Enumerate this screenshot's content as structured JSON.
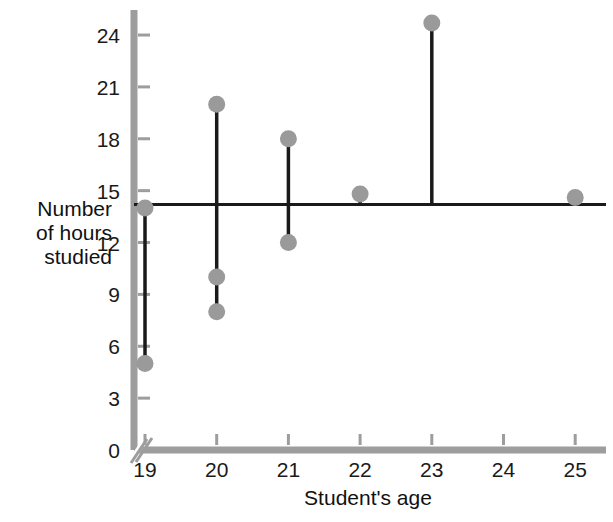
{
  "chart_data": {
    "type": "scatter",
    "title": "",
    "xlabel": "Student's age",
    "ylabel": "Number of hours studied",
    "ylabel_lines": [
      "Number",
      "of hours",
      "studied"
    ],
    "x": [
      19,
      20,
      21,
      22,
      23,
      24,
      25
    ],
    "xticklabels": [
      "19",
      "20",
      "21",
      "22",
      "23",
      "24",
      "25"
    ],
    "yticks": [
      0,
      3,
      6,
      9,
      12,
      15,
      18,
      21,
      24
    ],
    "yticklabels": [
      "0",
      "3",
      "6",
      "9",
      "12",
      "15",
      "18",
      "21",
      "24"
    ],
    "xlim": [
      18.6,
      25.6
    ],
    "ylim": [
      0,
      25.6
    ],
    "grid": false,
    "legend": null,
    "axis_break": true,
    "reference_line": {
      "name": "mean-line",
      "type": "horizontal",
      "value": 14.2,
      "color": "#1a1a1a"
    },
    "points": [
      {
        "x": 19,
        "y": 14.0
      },
      {
        "x": 19,
        "y": 5.0
      },
      {
        "x": 20,
        "y": 20.0
      },
      {
        "x": 20,
        "y": 10.0
      },
      {
        "x": 20,
        "y": 8.0
      },
      {
        "x": 21,
        "y": 18.0
      },
      {
        "x": 21,
        "y": 12.0
      },
      {
        "x": 22,
        "y": 14.8
      },
      {
        "x": 23,
        "y": 24.7
      },
      {
        "x": 25,
        "y": 14.6
      }
    ],
    "residual_stems": [
      {
        "x": 19,
        "from": 14.2,
        "to": 14.0
      },
      {
        "x": 19,
        "from": 14.2,
        "to": 5.0
      },
      {
        "x": 20,
        "from": 14.2,
        "to": 20.0
      },
      {
        "x": 20,
        "from": 14.2,
        "to": 8.0
      },
      {
        "x": 21,
        "from": 14.2,
        "to": 18.0
      },
      {
        "x": 21,
        "from": 14.2,
        "to": 12.0
      },
      {
        "x": 22,
        "from": 14.2,
        "to": 14.8
      },
      {
        "x": 23,
        "from": 14.2,
        "to": 24.7
      },
      {
        "x": 25,
        "from": 14.2,
        "to": 14.6
      }
    ],
    "colors": {
      "marker": "#9a9a9a",
      "stem": "#1a1a1a",
      "axis": "#9d9d9d",
      "text": "#111111"
    }
  }
}
